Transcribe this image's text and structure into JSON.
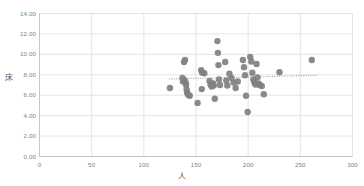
{
  "chart_data": {
    "type": "scatter",
    "title": "",
    "xlabel": "人",
    "ylabel": "床",
    "xlim": [
      0,
      300
    ],
    "ylim": [
      0,
      14
    ],
    "xticks": [
      0,
      50,
      100,
      150,
      200,
      250,
      300
    ],
    "xtick_labels": [
      "0",
      "50",
      "100",
      "150",
      "200",
      "250",
      "300"
    ],
    "yticks": [
      0,
      2,
      4,
      6,
      8,
      10,
      12,
      14
    ],
    "ytick_labels": [
      "0.00",
      "2.00",
      "4.00",
      "6.00",
      "8.00",
      "10.00",
      "12.00",
      "14.00"
    ],
    "grid": true,
    "grid_axis": "both",
    "legend": false,
    "marker_color": "#808080",
    "marker_size": 3.2,
    "gridline_color": "#d9d9d9",
    "axis_color": "#bfbfbf",
    "tick_label_color": "#7f7f7f",
    "series": [
      {
        "name": "series1",
        "points": [
          [
            125.0,
            6.7
          ],
          [
            137.0,
            7.7
          ],
          [
            137.5,
            7.35
          ],
          [
            138.5,
            9.25
          ],
          [
            139.5,
            9.45
          ],
          [
            139.0,
            7.5
          ],
          [
            140.0,
            7.25
          ],
          [
            140.5,
            7.0
          ],
          [
            141.0,
            6.55
          ],
          [
            141.5,
            6.25
          ],
          [
            142.5,
            6.05
          ],
          [
            144.0,
            5.95
          ],
          [
            151.5,
            5.25
          ],
          [
            155.0,
            8.45
          ],
          [
            156.0,
            8.2
          ],
          [
            155.5,
            6.6
          ],
          [
            158.0,
            8.15
          ],
          [
            163.0,
            7.4
          ],
          [
            164.0,
            7.05
          ],
          [
            165.0,
            6.85
          ],
          [
            166.5,
            7.15
          ],
          [
            167.0,
            6.95
          ],
          [
            168.0,
            5.65
          ],
          [
            170.5,
            11.3
          ],
          [
            171.0,
            10.15
          ],
          [
            171.5,
            8.95
          ],
          [
            172.0,
            7.55
          ],
          [
            173.0,
            7.0
          ],
          [
            178.0,
            9.25
          ],
          [
            179.0,
            7.45
          ],
          [
            180.0,
            6.95
          ],
          [
            182.0,
            8.1
          ],
          [
            184.0,
            7.7
          ],
          [
            186.0,
            7.25
          ],
          [
            188.0,
            6.7
          ],
          [
            190.0,
            7.35
          ],
          [
            195.0,
            9.45
          ],
          [
            196.0,
            8.75
          ],
          [
            197.0,
            7.95
          ],
          [
            198.0,
            5.95
          ],
          [
            199.5,
            4.35
          ],
          [
            202.0,
            9.75
          ],
          [
            203.0,
            9.3
          ],
          [
            204.0,
            8.2
          ],
          [
            205.0,
            7.55
          ],
          [
            206.0,
            7.25
          ],
          [
            207.0,
            7.05
          ],
          [
            208.0,
            9.05
          ],
          [
            209.0,
            7.75
          ],
          [
            210.0,
            7.15
          ],
          [
            211.0,
            7.0
          ],
          [
            213.0,
            6.9
          ],
          [
            215.0,
            6.1
          ],
          [
            230.0,
            8.25
          ],
          [
            261.0,
            9.45
          ]
        ]
      }
    ],
    "trendline": {
      "style": "dotted",
      "color": "#808080",
      "x_start": 124.0,
      "y_start": 7.58,
      "x_end": 266.0,
      "y_end": 7.95
    }
  }
}
